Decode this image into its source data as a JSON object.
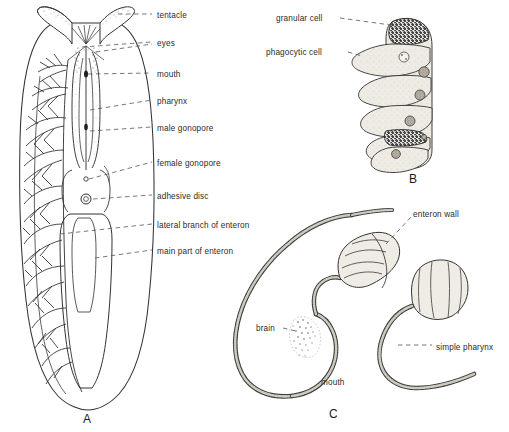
{
  "figure": {
    "background_color": "#ffffff",
    "ink_color": "#2b2b2b",
    "stipple_color": "#6e6e6e",
    "fill_color": "#efece6"
  },
  "panels": [
    {
      "id": "A",
      "letter": "A",
      "letter_pos": {
        "x": 83,
        "y": 412
      },
      "description": "whole-animal dorsal view with branched enteron",
      "labels": [
        {
          "name": "tentacle",
          "text": "tentacle",
          "x": 157,
          "y": 11
        },
        {
          "name": "eyes",
          "text": "eyes",
          "x": 157,
          "y": 39
        },
        {
          "name": "mouth",
          "text": "mouth",
          "x": 157,
          "y": 70
        },
        {
          "name": "pharynx",
          "text": "pharynx",
          "x": 157,
          "y": 97
        },
        {
          "name": "male-gonopore",
          "text": "male gonopore",
          "x": 157,
          "y": 124
        },
        {
          "name": "female-gonopore",
          "text": "female gonopore",
          "x": 157,
          "y": 159
        },
        {
          "name": "adhesive-disc",
          "text": "adhesive disc",
          "x": 157,
          "y": 192
        },
        {
          "name": "lateral-branch-of-enteron",
          "text": "lateral branch of enteron",
          "x": 157,
          "y": 221
        },
        {
          "name": "main-part-of-enteron",
          "text": "main part of enteron",
          "x": 157,
          "y": 247
        }
      ]
    },
    {
      "id": "B",
      "letter": "B",
      "letter_pos": {
        "x": 409,
        "y": 172
      },
      "description": "enteron epithelium cell types",
      "labels": [
        {
          "name": "granular-cell",
          "text": "granular cell",
          "x": 276,
          "y": 14,
          "align": "right"
        },
        {
          "name": "phagocytic-cell",
          "text": "phagocytic cell",
          "x": 266,
          "y": 48,
          "align": "right"
        }
      ]
    },
    {
      "id": "C",
      "letter": "C",
      "letter_pos": {
        "x": 329,
        "y": 407
      },
      "description": "sagittal section through anterior gut and pharynx",
      "labels": [
        {
          "name": "enteron-wall",
          "text": "enteron wall",
          "x": 413,
          "y": 210
        },
        {
          "name": "brain",
          "text": "brain",
          "x": 256,
          "y": 324
        },
        {
          "name": "simple-pharynx",
          "text": "simple pharynx",
          "x": 436,
          "y": 343
        },
        {
          "name": "mouth",
          "text": "mouth",
          "x": 321,
          "y": 378
        }
      ]
    }
  ]
}
